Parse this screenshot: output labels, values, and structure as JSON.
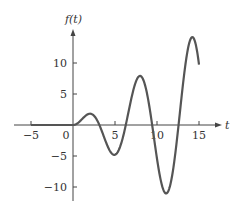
{
  "chart_data": {
    "type": "line",
    "title": "",
    "xlabel": "t",
    "ylabel": "f(t)",
    "xlim": [
      -6.5,
      18
    ],
    "ylim": [
      -12.5,
      15
    ],
    "x_ticks": [
      -5,
      0,
      5,
      10,
      15
    ],
    "x_tick_labels": [
      "−5",
      "0",
      "5",
      "10",
      "15"
    ],
    "y_ticks": [
      10,
      5,
      -5,
      -10
    ],
    "y_tick_labels": [
      "10",
      "5",
      "−5",
      "−10"
    ],
    "grid": false,
    "legend": null,
    "series": [
      {
        "name": "f(t)",
        "description": "f(t) = 0 for t < 0, t·sin(t) for t ≥ 0",
        "x": [
          -5,
          -4,
          -3,
          -2,
          -1,
          0,
          1,
          2,
          3,
          4,
          5,
          6,
          7,
          8,
          9,
          10,
          11,
          12,
          13,
          14,
          15
        ],
        "y": [
          0,
          0,
          0,
          0,
          0,
          0,
          0.84,
          1.82,
          0.42,
          -3.03,
          -4.79,
          -1.68,
          4.6,
          7.91,
          3.71,
          -5.44,
          -11.0,
          -6.44,
          5.46,
          13.87,
          9.75
        ]
      }
    ],
    "annotations": []
  },
  "colors": {
    "curve": "#555555",
    "axis": "#444444",
    "text": "#333333"
  }
}
